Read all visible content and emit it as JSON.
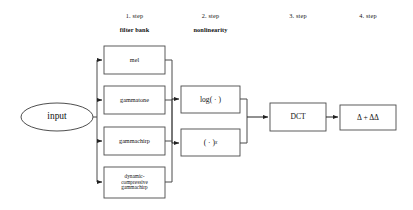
{
  "figure": {
    "background": "#ffffff",
    "stroke": "#3a3a3a"
  },
  "steps": [
    {
      "number": "1. step",
      "name": "filter bank"
    },
    {
      "number": "2. step",
      "name": "nonlinearity"
    },
    {
      "number": "3. step",
      "name": ""
    },
    {
      "number": "4. step",
      "name": ""
    }
  ],
  "input_node": {
    "label": "input"
  },
  "filter_bank": {
    "items": [
      {
        "label": "mel"
      },
      {
        "label": "gammatone"
      },
      {
        "label": "gammachirp"
      },
      {
        "label": "dynamic-\ncompressive\ngammachirp"
      }
    ]
  },
  "nonlinearity": {
    "items": [
      {
        "label": "log( · )"
      },
      {
        "label_base": "( · )",
        "label_exponent": "x"
      }
    ]
  },
  "dct_node": {
    "label": "DCT"
  },
  "delta_node": {
    "label": "Δ + ΔΔ"
  }
}
